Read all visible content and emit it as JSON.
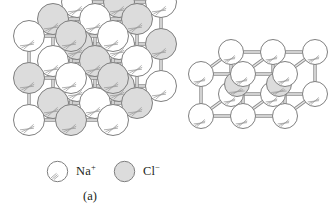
{
  "figure": {
    "background": "#ffffff"
  },
  "style": {
    "cation_fill": "#ffffff",
    "anion_fill": "#dcdcdc",
    "outline": "#7f7f7f",
    "bond": "#b0b0b0",
    "bond_edge": "#8c8c8c",
    "hatch": "#9a9a9a",
    "text": "#231f20"
  },
  "panels": [
    {
      "id": "a",
      "caption": "(a)",
      "compound": "NaCl",
      "lattice_type": "rock-salt (face-centered cubic)",
      "grid": [
        3,
        3,
        3
      ],
      "legend": [
        {
          "key": "na",
          "species": "Na",
          "charge": "+",
          "label": "Na",
          "sup": "+",
          "fill": "#ffffff"
        },
        {
          "key": "cl",
          "species": "Cl",
          "charge": "−",
          "label": "Cl",
          "sup": "−",
          "fill": "#dcdcdc"
        }
      ]
    },
    {
      "id": "b",
      "caption": "(b)",
      "compound": "CsCl",
      "lattice_type": "body-centered cubic",
      "grid": [
        3,
        2,
        2
      ],
      "legend": [
        {
          "key": "cs",
          "species": "Cs",
          "charge": "+",
          "label": "Cs",
          "sup": "+",
          "fill": "#ffffff"
        },
        {
          "key": "cl",
          "species": "Cl",
          "charge": "−",
          "label": "Cl",
          "sup": "−",
          "fill": "#dcdcdc"
        }
      ]
    }
  ],
  "chart_data": {
    "type": "diagram",
    "structures": [
      {
        "name": "NaCl",
        "caption": "(a)",
        "lattice": "rock-salt",
        "dims": {
          "nx": 3,
          "ny": 3,
          "nz": 3
        },
        "site_count": 27,
        "cation": "Na+",
        "anion": "Cl-",
        "alternating": true,
        "projection": {
          "ax": 25,
          "ay": -17,
          "sphere_r": 15,
          "origin": [
            30,
            118
          ]
        }
      },
      {
        "name": "CsCl",
        "caption": "(b)",
        "lattice": "body-centered cubic",
        "dims": {
          "nx": 3,
          "ny": 2,
          "nz": 2
        },
        "site_count": 12,
        "body_centers": 2,
        "cation": "Cs+",
        "anion": "Cl-",
        "projection": {
          "ax": 38,
          "ay": -25,
          "sphere_r": 12,
          "origin": [
            18,
            114
          ]
        }
      }
    ]
  }
}
